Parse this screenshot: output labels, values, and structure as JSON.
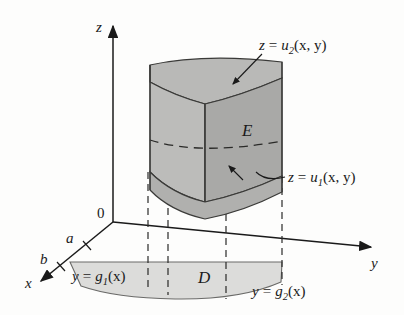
{
  "figure": {
    "background_color": "#fdfdfc",
    "ink_color": "#1a1a1a"
  },
  "axes": {
    "z": {
      "label": "z"
    },
    "y": {
      "label": "y"
    },
    "x": {
      "label": "x"
    },
    "origin": {
      "label": "0"
    },
    "ticks": [
      {
        "label": "a",
        "axis": "x"
      },
      {
        "label": "b",
        "axis": "x"
      }
    ]
  },
  "labels": {
    "upper_surface": {
      "var": "z",
      "eq": "=",
      "fn": "u",
      "sub": "2",
      "args": "(x, y)"
    },
    "lower_surface": {
      "var": "z",
      "eq": "=",
      "fn": "u",
      "sub": "1",
      "args": "(x, y)"
    },
    "left_boundary": {
      "var": "y",
      "eq": "=",
      "fn": "g",
      "sub": "1",
      "args": "(x)"
    },
    "right_boundary": {
      "var": "y",
      "eq": "=",
      "fn": "g",
      "sub": "2",
      "args": "(x)"
    },
    "solid": "E",
    "projection": "D"
  },
  "colors": {
    "solid_top": "#b9b9b7",
    "solid_left_face": "#bcbcba",
    "solid_right_face": "#a9a9a7",
    "solid_front_face": "#b3b3b1",
    "solid_bottom": "#b0b0ae",
    "projection_fill": "#dcdcda",
    "stroke": "#3a3a38"
  }
}
